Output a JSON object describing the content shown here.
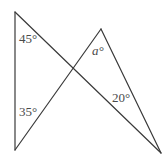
{
  "figure": {
    "kind": "geometry-diagram",
    "width": 167,
    "height": 161,
    "background_color": "#ffffff",
    "stroke_color": "#3a3a3a",
    "stroke_width": 1.2,
    "text_color": "#4a4a4a"
  },
  "points": {
    "top_left": {
      "name": "A",
      "x": 15,
      "y": 12
    },
    "bottom_left": {
      "name": "B",
      "x": 15,
      "y": 150
    },
    "apex": {
      "name": "C",
      "x": 101,
      "y": 29
    },
    "bottom_right": {
      "name": "D",
      "x": 161,
      "y": 153
    },
    "crossing": {
      "name": "X",
      "x": 73,
      "y": 72
    }
  },
  "segments": [
    {
      "name": "left-vertical-side",
      "from": "top_left",
      "to": "bottom_left"
    },
    {
      "name": "topleft-to-bottomright",
      "from": "top_left",
      "to": "bottom_right"
    },
    {
      "name": "bottomleft-to-apex",
      "from": "bottom_left",
      "to": "apex"
    },
    {
      "name": "apex-to-bottomright",
      "from": "apex",
      "to": "bottom_right"
    }
  ],
  "labels": {
    "angle_top_left": {
      "text": "45°",
      "vertex": "top_left",
      "italic": false
    },
    "angle_bottom_left": {
      "text": "35°",
      "vertex": "bottom_left",
      "italic": false
    },
    "angle_apex": {
      "text": "a°",
      "vertex": "apex",
      "italic": true
    },
    "angle_bottom_right": {
      "text": "20°",
      "vertex": "bottom_right",
      "italic": false
    }
  }
}
